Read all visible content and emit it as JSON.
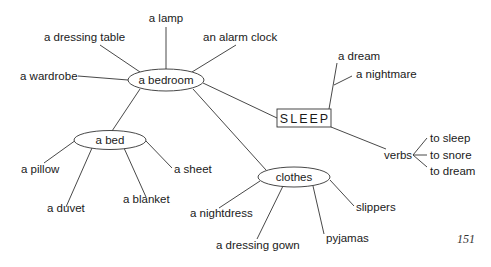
{
  "title": "SLEEP",
  "hubs": {
    "bedroom": "a bedroom",
    "bed": "a bed",
    "clothes": "clothes",
    "verbs": "verbs"
  },
  "bedroom_items": {
    "lamp": "a lamp",
    "dressing_table": "a dressing table",
    "alarm_clock": "an alarm clock",
    "wardrobe": "a wardrobe"
  },
  "bed_items": {
    "pillow": "a pillow",
    "duvet": "a duvet",
    "blanket": "a blanket",
    "sheet": "a sheet"
  },
  "clothes_items": {
    "nightdress": "a nightdress",
    "dressing_gown": "a dressing gown",
    "pyjamas": "pyjamas",
    "slippers": "slippers"
  },
  "sleep_items": {
    "dream": "a dream",
    "nightmare": "a nightmare"
  },
  "verb_items": {
    "sleep": "to sleep",
    "snore": "to snore",
    "dream": "to dream"
  },
  "page_number": "151"
}
